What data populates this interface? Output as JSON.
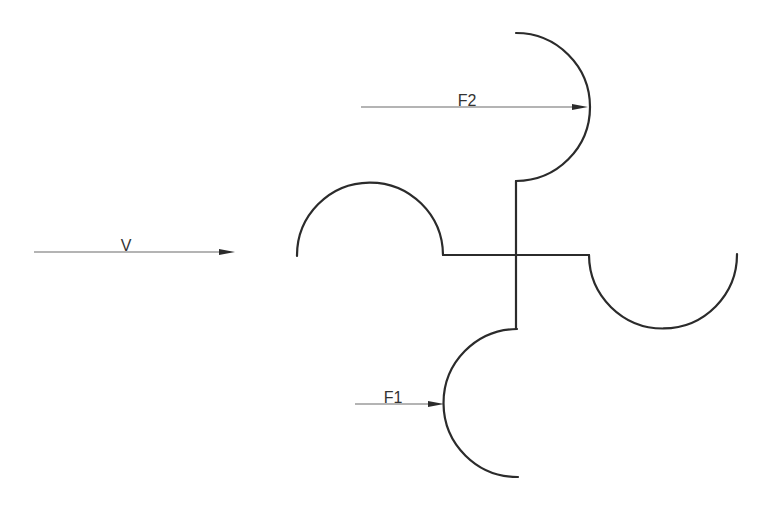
{
  "diagram": {
    "title": "",
    "colors": {
      "stroke": "#2b2b2b",
      "arrow_line": "#6a6a6a",
      "background": "#ffffff"
    },
    "arrows": [
      {
        "id": "velocity",
        "label": "V",
        "x1": 34,
        "y": 252,
        "x2": 235,
        "label_x": 126,
        "label_y": 251
      },
      {
        "id": "force-2",
        "label": "F2",
        "x1": 361,
        "y": 107,
        "x2": 588,
        "label_x": 467,
        "label_y": 106
      },
      {
        "id": "force-1",
        "label": "F1",
        "x1": 355,
        "y": 404,
        "x2": 444,
        "label_x": 393,
        "label_y": 403
      }
    ],
    "rotor": {
      "hub": {
        "x": 516,
        "y": 255
      },
      "cups": [
        {
          "id": "top-cup",
          "orientation": "open-left",
          "center": [
            516,
            107
          ],
          "radius": 74
        },
        {
          "id": "right-cup",
          "orientation": "open-up",
          "center": [
            663,
            255
          ],
          "radius": 74
        },
        {
          "id": "bottom-cup",
          "orientation": "open-right",
          "center": [
            517,
            403
          ],
          "radius": 74
        },
        {
          "id": "left-cup",
          "orientation": "open-down",
          "center": [
            370,
            255
          ],
          "radius": 73
        }
      ]
    }
  }
}
